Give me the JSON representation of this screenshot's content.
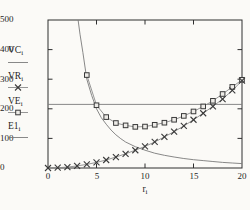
{
  "figure": {
    "background": "#fbfaf7",
    "frame_color": "#2f2f2f",
    "tick_color": "#2f2f2f",
    "text_color": "#1f1f1f",
    "marker_ink": "#3a3a3a",
    "square_fill": "#edebe7"
  },
  "axes": {
    "x": {
      "label_base": "r",
      "label_sub": "i",
      "tick_labels": [
        "0",
        "5",
        "10",
        "15",
        "20"
      ]
    },
    "y": {
      "tick_labels": [
        "500",
        "400",
        "300",
        "200",
        "100",
        "0"
      ]
    }
  },
  "chart_data": {
    "type": "line",
    "title": "",
    "xlabel": "r_i",
    "ylabel": "",
    "xlim": [
      0,
      20
    ],
    "ylim": [
      0,
      500
    ],
    "xticks": [
      0,
      5,
      10,
      15,
      20
    ],
    "yticks": [
      0,
      100,
      200,
      300,
      400,
      500
    ],
    "grid": false,
    "frame_ticks_all_sides": true,
    "legend_position": "left-outside",
    "legend": [
      {
        "base": "VC",
        "sub": "i",
        "marker": "none"
      },
      {
        "base": "VR",
        "sub": "i",
        "marker": "x"
      },
      {
        "base": "VE",
        "sub": "i",
        "marker": "square"
      },
      {
        "base": "E1",
        "sub": "i",
        "marker": "none"
      }
    ],
    "series": [
      {
        "name": "VC_i",
        "marker": "none",
        "color": "#7a7a7a",
        "width": 0.9,
        "points": [
          [
            3.1,
            500
          ],
          [
            3.3,
            452
          ],
          [
            3.6,
            390
          ],
          [
            4,
            300
          ],
          [
            4.5,
            245
          ],
          [
            5,
            200
          ],
          [
            5.5,
            170
          ],
          [
            6,
            148
          ],
          [
            6.5,
            128
          ],
          [
            7,
            112
          ],
          [
            7.5,
            99
          ],
          [
            8,
            88
          ],
          [
            9,
            72
          ],
          [
            10,
            60
          ],
          [
            11,
            50
          ],
          [
            12,
            43
          ],
          [
            13,
            37
          ],
          [
            14,
            32
          ],
          [
            15,
            28
          ],
          [
            16,
            25
          ],
          [
            17,
            22
          ],
          [
            18,
            19
          ],
          [
            19,
            17
          ],
          [
            20,
            15
          ]
        ]
      },
      {
        "name": "E1_i",
        "marker": "none",
        "color": "#7a7a7a",
        "width": 0.9,
        "points": [
          [
            0,
            215
          ],
          [
            20,
            215
          ]
        ]
      },
      {
        "name": "VE_i",
        "marker": "square",
        "color": "#8a8a8a",
        "width": 0.9,
        "points": [
          [
            4,
            314
          ],
          [
            5,
            212
          ],
          [
            6,
            172
          ],
          [
            7,
            152
          ],
          [
            8,
            144
          ],
          [
            9,
            139
          ],
          [
            10,
            140
          ],
          [
            11,
            146
          ],
          [
            12,
            153
          ],
          [
            13,
            163
          ],
          [
            14,
            176
          ],
          [
            15,
            191
          ],
          [
            16,
            208
          ],
          [
            17,
            227
          ],
          [
            18,
            250
          ],
          [
            19,
            274
          ],
          [
            20,
            298
          ]
        ]
      },
      {
        "name": "VR_i",
        "marker": "x",
        "color": "#8a8a8a",
        "width": 0.9,
        "points": [
          [
            0,
            0
          ],
          [
            1,
            1
          ],
          [
            2,
            3
          ],
          [
            3,
            7
          ],
          [
            4,
            12
          ],
          [
            5,
            19
          ],
          [
            6,
            27
          ],
          [
            7,
            37
          ],
          [
            8,
            48
          ],
          [
            9,
            60
          ],
          [
            10,
            73
          ],
          [
            11,
            88
          ],
          [
            12,
            105
          ],
          [
            13,
            123
          ],
          [
            14,
            142
          ],
          [
            15,
            163
          ],
          [
            16,
            185
          ],
          [
            17,
            208
          ],
          [
            18,
            233
          ],
          [
            19,
            262
          ],
          [
            20,
            295
          ]
        ]
      }
    ]
  }
}
